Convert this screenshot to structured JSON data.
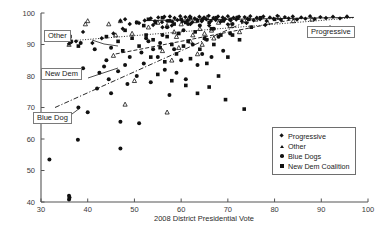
{
  "chart_data": {
    "type": "scatter",
    "title": "",
    "xlabel": "2008 District Presidential Vote",
    "ylabel": "",
    "xlim": [
      30,
      100
    ],
    "ylim": [
      40,
      100
    ],
    "xticks": [
      30,
      40,
      50,
      60,
      70,
      80,
      90,
      100
    ],
    "yticks": [
      40,
      50,
      60,
      70,
      80,
      90,
      100
    ],
    "grid": false,
    "legend_position": "lower-right",
    "legend": [
      "Progressive",
      "Other",
      "Blue Dogs",
      "New Dem Coalition"
    ],
    "annotations": [
      {
        "label": "Other",
        "x": 36.0,
        "y": 91.5
      },
      {
        "label": "New Dem",
        "x": 36.0,
        "y": 80.0
      },
      {
        "label": "Blue Dog",
        "x": 35.0,
        "y": 67.5
      },
      {
        "label": "Progressive",
        "x": 85.0,
        "y": 93.0
      }
    ],
    "series": [
      {
        "name": "Progressive",
        "marker": "diamond",
        "trendline": {
          "style": "solid",
          "x": [
            52,
            97
          ],
          "y": [
            97.6,
            98.6
          ]
        },
        "points": [
          [
            52.2,
            97.6
          ],
          [
            53.5,
            98.3
          ],
          [
            54.4,
            97.4
          ],
          [
            55.1,
            98.6
          ],
          [
            55.9,
            97.1
          ],
          [
            56.4,
            98.8
          ],
          [
            57.0,
            97.5
          ],
          [
            57.6,
            98.9
          ],
          [
            58.1,
            97.2
          ],
          [
            58.6,
            98.4
          ],
          [
            59.2,
            97.8
          ],
          [
            59.8,
            99.0
          ],
          [
            60.3,
            97.3
          ],
          [
            60.9,
            98.7
          ],
          [
            61.4,
            97.6
          ],
          [
            61.9,
            98.9
          ],
          [
            62.4,
            97.1
          ],
          [
            62.9,
            98.3
          ],
          [
            63.4,
            97.9
          ],
          [
            63.9,
            98.8
          ],
          [
            64.4,
            97.4
          ],
          [
            64.9,
            98.6
          ],
          [
            65.4,
            98.0
          ],
          [
            65.9,
            99.1
          ],
          [
            66.4,
            97.5
          ],
          [
            66.9,
            98.4
          ],
          [
            67.4,
            97.8
          ],
          [
            67.9,
            98.9
          ],
          [
            68.4,
            97.2
          ],
          [
            68.9,
            98.6
          ],
          [
            69.4,
            98.1
          ],
          [
            70.0,
            99.0
          ],
          [
            70.6,
            97.6
          ],
          [
            71.2,
            98.5
          ],
          [
            71.8,
            97.9
          ],
          [
            72.4,
            98.8
          ],
          [
            73.0,
            97.4
          ],
          [
            73.6,
            98.7
          ],
          [
            74.2,
            98.2
          ],
          [
            74.8,
            99.0
          ],
          [
            75.5,
            97.7
          ],
          [
            76.2,
            98.5
          ],
          [
            76.9,
            98.0
          ],
          [
            77.6,
            98.9
          ],
          [
            78.3,
            97.5
          ],
          [
            79.0,
            98.6
          ],
          [
            79.8,
            98.2
          ],
          [
            80.6,
            99.1
          ],
          [
            81.4,
            97.8
          ],
          [
            82.2,
            98.7
          ],
          [
            83.0,
            98.3
          ],
          [
            83.9,
            98.9
          ],
          [
            84.8,
            97.9
          ],
          [
            85.7,
            98.6
          ],
          [
            86.6,
            98.2
          ],
          [
            87.6,
            99.0
          ],
          [
            88.6,
            98.1
          ],
          [
            89.8,
            98.7
          ],
          [
            91.0,
            98.4
          ],
          [
            92.5,
            98.8
          ],
          [
            94.0,
            98.3
          ],
          [
            95.5,
            98.9
          ],
          [
            49.0,
            96.5
          ],
          [
            50.5,
            97.0
          ],
          [
            47.5,
            95.0
          ],
          [
            45.5,
            93.5
          ],
          [
            43.0,
            92.0
          ],
          [
            41.0,
            90.5
          ],
          [
            39.0,
            94.0
          ],
          [
            37.5,
            91.0
          ],
          [
            36.5,
            90.8
          ],
          [
            36.0,
            90.2
          ],
          [
            35.8,
            91.8
          ],
          [
            47.0,
            97.5
          ],
          [
            48.0,
            98.0
          ],
          [
            51.0,
            96.8
          ],
          [
            54.0,
            96.2
          ],
          [
            56.0,
            95.5
          ],
          [
            58.0,
            96.0
          ],
          [
            62.0,
            96.5
          ],
          [
            66.0,
            96.0
          ],
          [
            70.0,
            96.4
          ],
          [
            74.0,
            96.8
          ],
          [
            78.0,
            96.2
          ]
        ]
      },
      {
        "name": "Other",
        "marker": "triangle",
        "trendline": {
          "style": "dotted",
          "x": [
            35,
            97
          ],
          "y": [
            91.0,
            98.5
          ]
        },
        "points": [
          [
            36.0,
            90.0
          ],
          [
            39.5,
            96.5
          ],
          [
            40.0,
            97.5
          ],
          [
            44.5,
            96.5
          ],
          [
            47.0,
            97.5
          ],
          [
            46.0,
            93.0
          ],
          [
            49.5,
            93.5
          ],
          [
            53.0,
            95.5
          ],
          [
            55.0,
            97.0
          ],
          [
            57.0,
            96.0
          ],
          [
            58.5,
            94.0
          ],
          [
            59.0,
            92.5
          ],
          [
            60.0,
            96.5
          ],
          [
            61.5,
            98.0
          ],
          [
            62.5,
            93.0
          ],
          [
            63.0,
            97.5
          ],
          [
            64.0,
            95.0
          ],
          [
            65.5,
            98.5
          ],
          [
            66.5,
            94.5
          ],
          [
            68.0,
            97.0
          ],
          [
            69.0,
            98.0
          ],
          [
            70.5,
            96.0
          ],
          [
            72.0,
            98.5
          ],
          [
            74.0,
            97.5
          ],
          [
            76.0,
            98.0
          ],
          [
            78.5,
            97.0
          ],
          [
            81.0,
            98.5
          ],
          [
            84.0,
            97.5
          ],
          [
            88.0,
            98.0
          ],
          [
            45.5,
            86.5
          ],
          [
            50.0,
            78.5
          ],
          [
            48.0,
            71.0
          ],
          [
            57.0,
            68.5
          ],
          [
            56.0,
            88.0
          ],
          [
            59.5,
            89.0
          ],
          [
            62.0,
            91.0
          ],
          [
            64.5,
            90.0
          ],
          [
            67.0,
            92.0
          ],
          [
            63.5,
            87.0
          ],
          [
            65.0,
            93.5
          ],
          [
            72.5,
            94.0
          ],
          [
            58.0,
            85.0
          ]
        ]
      },
      {
        "name": "Blue Dogs",
        "marker": "circle",
        "trendline": {
          "style": "dashdot",
          "x": [
            33,
            75
          ],
          "y": [
            70.0,
            98.0
          ]
        },
        "points": [
          [
            31.8,
            53.5
          ],
          [
            36.0,
            40.8
          ],
          [
            36.1,
            41.4
          ],
          [
            36.0,
            42.0
          ],
          [
            37.9,
            59.8
          ],
          [
            40.0,
            68.5
          ],
          [
            47.0,
            57.0
          ],
          [
            47.0,
            65.5
          ],
          [
            51.0,
            65.0
          ],
          [
            38.0,
            70.0
          ],
          [
            42.0,
            76.0
          ],
          [
            44.5,
            79.0
          ],
          [
            39.0,
            82.5
          ],
          [
            43.5,
            83.0
          ],
          [
            45.0,
            74.5
          ],
          [
            48.5,
            77.5
          ],
          [
            50.5,
            80.0
          ],
          [
            52.0,
            84.0
          ],
          [
            53.5,
            78.0
          ],
          [
            55.0,
            86.0
          ],
          [
            56.5,
            82.0
          ],
          [
            57.5,
            74.0
          ],
          [
            58.5,
            88.5
          ],
          [
            60.0,
            85.0
          ],
          [
            61.0,
            79.0
          ],
          [
            62.5,
            90.0
          ],
          [
            63.5,
            83.5
          ],
          [
            64.5,
            87.0
          ],
          [
            65.5,
            91.5
          ],
          [
            66.5,
            86.0
          ],
          [
            68.0,
            92.5
          ],
          [
            69.0,
            88.0
          ],
          [
            70.5,
            93.5
          ],
          [
            59.0,
            81.0
          ],
          [
            54.0,
            88.5
          ],
          [
            49.0,
            86.0
          ],
          [
            45.0,
            89.0
          ],
          [
            41.5,
            88.5
          ],
          [
            38.5,
            90.5
          ],
          [
            52.5,
            92.0
          ],
          [
            56.0,
            93.0
          ],
          [
            60.5,
            94.5
          ],
          [
            46.5,
            81.5
          ],
          [
            51.5,
            87.5
          ],
          [
            55.5,
            90.5
          ],
          [
            67.0,
            95.0
          ],
          [
            71.0,
            96.5
          ],
          [
            44.0,
            85.0
          ],
          [
            42.5,
            81.0
          ],
          [
            48.0,
            83.5
          ],
          [
            53.0,
            91.0
          ],
          [
            57.0,
            95.5
          ],
          [
            61.5,
            96.5
          ],
          [
            64.0,
            96.0
          ]
        ]
      },
      {
        "name": "New Dem Coalition",
        "marker": "square",
        "trendline": {
          "style": "dashed",
          "x": [
            46,
            86
          ],
          "y": [
            87.0,
            98.5
          ]
        },
        "points": [
          [
            36.2,
            92.5
          ],
          [
            36.4,
            91.0
          ],
          [
            38.0,
            89.5
          ],
          [
            50.5,
            97.0
          ],
          [
            52.0,
            96.0
          ],
          [
            53.0,
            98.0
          ],
          [
            54.5,
            97.0
          ],
          [
            56.0,
            98.5
          ],
          [
            57.5,
            97.5
          ],
          [
            58.5,
            96.5
          ],
          [
            60.0,
            98.0
          ],
          [
            61.0,
            97.0
          ],
          [
            62.0,
            98.5
          ],
          [
            63.5,
            97.5
          ],
          [
            64.5,
            98.0
          ],
          [
            66.0,
            97.0
          ],
          [
            67.5,
            98.5
          ],
          [
            69.0,
            97.5
          ],
          [
            70.5,
            98.0
          ],
          [
            72.0,
            98.5
          ],
          [
            74.5,
            98.0
          ],
          [
            77.0,
            98.5
          ],
          [
            80.0,
            98.0
          ],
          [
            52.5,
            93.0
          ],
          [
            54.0,
            91.5
          ],
          [
            55.5,
            89.0
          ],
          [
            57.0,
            92.5
          ],
          [
            58.0,
            90.0
          ],
          [
            59.5,
            93.5
          ],
          [
            61.5,
            91.0
          ],
          [
            63.0,
            94.0
          ],
          [
            65.0,
            92.0
          ],
          [
            66.5,
            95.0
          ],
          [
            68.5,
            93.0
          ],
          [
            48.0,
            94.5
          ],
          [
            46.5,
            91.0
          ],
          [
            44.0,
            92.5
          ],
          [
            51.0,
            89.5
          ],
          [
            53.5,
            86.0
          ],
          [
            56.5,
            84.5
          ],
          [
            59.0,
            87.0
          ],
          [
            62.0,
            85.5
          ],
          [
            49.5,
            92.0
          ],
          [
            47.5,
            88.0
          ],
          [
            60.5,
            89.5
          ],
          [
            64.0,
            88.5
          ],
          [
            67.0,
            90.0
          ],
          [
            71.0,
            93.0
          ],
          [
            55.0,
            80.5
          ],
          [
            58.0,
            78.5
          ],
          [
            61.0,
            77.0
          ],
          [
            65.5,
            84.0
          ],
          [
            70.0,
            86.0
          ],
          [
            66.0,
            76.5
          ],
          [
            68.0,
            80.0
          ],
          [
            72.5,
            91.5
          ],
          [
            75.0,
            95.5
          ],
          [
            63.5,
            74.5
          ],
          [
            69.5,
            72.5
          ],
          [
            73.5,
            69.5
          ]
        ]
      }
    ]
  }
}
